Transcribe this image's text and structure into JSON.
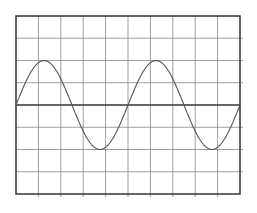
{
  "chart_data": {
    "type": "line",
    "title": "",
    "xlabel": "",
    "ylabel": "",
    "grid": true,
    "grid_divisions": {
      "x": 10,
      "y": 8
    },
    "axis_ranges": {
      "x": [
        0,
        10
      ],
      "y": [
        -4,
        4
      ]
    },
    "series": [
      {
        "name": "sine wave",
        "function": "2*sin(2*pi*x/5)",
        "amplitude_divisions": 2,
        "period_divisions": 5,
        "cycles": 2,
        "x": [
          0,
          1.25,
          2.5,
          3.75,
          5,
          6.25,
          7.5,
          8.75,
          10
        ],
        "y": [
          0,
          2,
          0,
          -2,
          0,
          2,
          0,
          -2,
          0
        ]
      }
    ],
    "colors": {
      "grid": "#888888",
      "frame": "#333333",
      "trace": "#555555",
      "background": "#ffffff"
    }
  },
  "plot_area": {
    "left": 16,
    "top": 16,
    "width": 224,
    "height": 178
  }
}
